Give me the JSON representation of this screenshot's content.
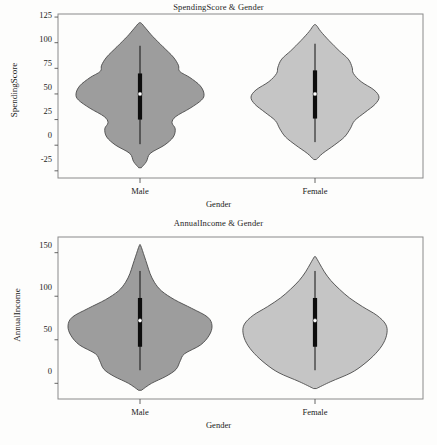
{
  "document": {
    "background_color": "#fdfdfc",
    "panel_count": 2
  },
  "charts": [
    {
      "id": "spending-score",
      "title": "SpendingScore & Gender",
      "xlabel": "Gender",
      "ylabel": "SpendingScore",
      "ytick_labels": [
        "125",
        "100",
        "75",
        "50",
        "25",
        "0",
        "-25"
      ],
      "xtick_labels": [
        "Male",
        "Female"
      ]
    },
    {
      "id": "annual-income",
      "title": "AnnualIncome & Gender",
      "xlabel": "Gender",
      "ylabel": "AnnualIncome",
      "ytick_labels": [
        "150",
        "100",
        "50",
        "0"
      ],
      "xtick_labels": [
        "Male",
        "Female"
      ]
    }
  ],
  "chart_data": [
    {
      "type": "violin",
      "id": "spending-score",
      "title": "SpendingScore & Gender",
      "xlabel": "Gender",
      "ylabel": "SpendingScore",
      "categories": [
        "Male",
        "Female"
      ],
      "ylim": [
        -32,
        128
      ],
      "yticks": [
        125,
        100,
        75,
        50,
        25,
        0,
        -25
      ],
      "grid": false,
      "legend": "none",
      "series": [
        {
          "name": "Male",
          "fill_color": "#9d9d9d",
          "edge_color": "#4a4a4a",
          "median": 50,
          "q1": 25,
          "q3": 70,
          "whisker_low": 1,
          "whisker_high": 97,
          "data_min": -22,
          "data_max": 119,
          "density_profile": [
            {
              "y": -22,
              "w": 0.02
            },
            {
              "y": -16,
              "w": 0.1
            },
            {
              "y": -8,
              "w": 0.16
            },
            {
              "y": 0,
              "w": 0.38
            },
            {
              "y": 8,
              "w": 0.52
            },
            {
              "y": 16,
              "w": 0.55
            },
            {
              "y": 22,
              "w": 0.5
            },
            {
              "y": 28,
              "w": 0.56
            },
            {
              "y": 36,
              "w": 0.78
            },
            {
              "y": 44,
              "w": 0.96
            },
            {
              "y": 50,
              "w": 1.0
            },
            {
              "y": 58,
              "w": 0.94
            },
            {
              "y": 66,
              "w": 0.78
            },
            {
              "y": 72,
              "w": 0.62
            },
            {
              "y": 78,
              "w": 0.6
            },
            {
              "y": 86,
              "w": 0.52
            },
            {
              "y": 96,
              "w": 0.36
            },
            {
              "y": 106,
              "w": 0.2
            },
            {
              "y": 114,
              "w": 0.09
            },
            {
              "y": 119,
              "w": 0.02
            }
          ]
        },
        {
          "name": "Female",
          "fill_color": "#c5c5c5",
          "edge_color": "#4a4a4a",
          "median": 50,
          "q1": 26,
          "q3": 73,
          "whisker_low": 3,
          "whisker_high": 99,
          "data_min": -14,
          "data_max": 117,
          "density_profile": [
            {
              "y": -14,
              "w": 0.02
            },
            {
              "y": -8,
              "w": 0.12
            },
            {
              "y": 0,
              "w": 0.3
            },
            {
              "y": 8,
              "w": 0.46
            },
            {
              "y": 16,
              "w": 0.55
            },
            {
              "y": 24,
              "w": 0.62
            },
            {
              "y": 32,
              "w": 0.78
            },
            {
              "y": 40,
              "w": 0.94
            },
            {
              "y": 47,
              "w": 1.0
            },
            {
              "y": 54,
              "w": 0.92
            },
            {
              "y": 62,
              "w": 0.72
            },
            {
              "y": 70,
              "w": 0.6
            },
            {
              "y": 76,
              "w": 0.58
            },
            {
              "y": 84,
              "w": 0.52
            },
            {
              "y": 92,
              "w": 0.38
            },
            {
              "y": 102,
              "w": 0.22
            },
            {
              "y": 111,
              "w": 0.09
            },
            {
              "y": 117,
              "w": 0.02
            }
          ]
        }
      ]
    },
    {
      "type": "violin",
      "id": "annual-income",
      "title": "AnnualIncome & Gender",
      "xlabel": "Gender",
      "ylabel": "AnnualIncome",
      "categories": [
        "Male",
        "Female"
      ],
      "ylim": [
        -18,
        168
      ],
      "yticks": [
        150,
        100,
        50,
        0
      ],
      "grid": false,
      "legend": "none",
      "series": [
        {
          "name": "Male",
          "fill_color": "#9d9d9d",
          "edge_color": "#4a4a4a",
          "median": 72,
          "q1": 42,
          "q3": 98,
          "whisker_low": 15,
          "whisker_high": 129,
          "data_min": -8,
          "data_max": 158,
          "density_profile": [
            {
              "y": -8,
              "w": 0.02
            },
            {
              "y": 0,
              "w": 0.16
            },
            {
              "y": 8,
              "w": 0.36
            },
            {
              "y": 16,
              "w": 0.5
            },
            {
              "y": 26,
              "w": 0.56
            },
            {
              "y": 34,
              "w": 0.62
            },
            {
              "y": 44,
              "w": 0.84
            },
            {
              "y": 55,
              "w": 0.96
            },
            {
              "y": 66,
              "w": 1.0
            },
            {
              "y": 76,
              "w": 0.94
            },
            {
              "y": 86,
              "w": 0.72
            },
            {
              "y": 96,
              "w": 0.48
            },
            {
              "y": 106,
              "w": 0.3
            },
            {
              "y": 116,
              "w": 0.2
            },
            {
              "y": 126,
              "w": 0.14
            },
            {
              "y": 136,
              "w": 0.1
            },
            {
              "y": 146,
              "w": 0.06
            },
            {
              "y": 158,
              "w": 0.01
            }
          ]
        },
        {
          "name": "Female",
          "fill_color": "#c5c5c5",
          "edge_color": "#4a4a4a",
          "median": 72,
          "q1": 42,
          "q3": 98,
          "whisker_low": 15,
          "whisker_high": 129,
          "data_min": -6,
          "data_max": 145,
          "density_profile": [
            {
              "y": -6,
              "w": 0.02
            },
            {
              "y": 2,
              "w": 0.22
            },
            {
              "y": 12,
              "w": 0.5
            },
            {
              "y": 22,
              "w": 0.68
            },
            {
              "y": 34,
              "w": 0.84
            },
            {
              "y": 46,
              "w": 0.95
            },
            {
              "y": 58,
              "w": 1.0
            },
            {
              "y": 68,
              "w": 0.98
            },
            {
              "y": 78,
              "w": 0.86
            },
            {
              "y": 88,
              "w": 0.66
            },
            {
              "y": 98,
              "w": 0.48
            },
            {
              "y": 108,
              "w": 0.34
            },
            {
              "y": 118,
              "w": 0.22
            },
            {
              "y": 128,
              "w": 0.13
            },
            {
              "y": 138,
              "w": 0.06
            },
            {
              "y": 145,
              "w": 0.01
            }
          ]
        }
      ]
    }
  ]
}
